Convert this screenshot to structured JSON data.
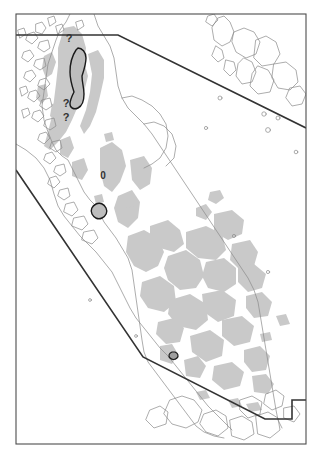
{
  "map": {
    "type": "distribution-range-map",
    "title": "",
    "background_color": "#ffffff",
    "frame": {
      "stroke": "#4d4d4d",
      "stroke_width": 1.1,
      "x": 16,
      "y": 14,
      "width": 290,
      "height": 430
    },
    "colors": {
      "frame_border": "#4d4d4d",
      "coastline": "#8a8a8a",
      "habitat_shading": "#c9c9c9",
      "range_boundary": "#333333",
      "core_polygon_fill": "#bdbdbd",
      "core_polygon_stroke": "#1a1a1a",
      "label_text": "#333333"
    },
    "labels": [
      {
        "text": "?",
        "x": 69,
        "y": 42,
        "size": 11
      },
      {
        "text": "?",
        "x": 66,
        "y": 107,
        "size": 11
      },
      {
        "text": "?",
        "x": 66,
        "y": 121,
        "size": 11
      },
      {
        "text": "0",
        "x": 103,
        "y": 179,
        "size": 10
      }
    ],
    "range_boundary_segments": [
      {
        "name": "northern-limit-horizontal",
        "points": "16,35 118,35"
      },
      {
        "name": "northern-limit-diagonal",
        "points": "118,35 306,128"
      },
      {
        "name": "southwestern-limit-diagonal",
        "points": "16,170 143,357"
      },
      {
        "name": "southern-limit-diagonal",
        "points": "143,357 265,419"
      },
      {
        "name": "southeastern-limit-step",
        "points": "265,419 292,419 292,400 306,400"
      }
    ],
    "core_polygons": [
      {
        "name": "northern-core-range",
        "x": 78,
        "y": 68,
        "label": "elongated highland core area"
      },
      {
        "name": "central-core-range",
        "x": 100,
        "y": 211,
        "label": "small isolated core area"
      },
      {
        "name": "southern-core-range",
        "x": 175,
        "y": 355,
        "label": "tiny southern core area"
      }
    ],
    "legend": {
      "visible": false,
      "items": []
    },
    "scale_bar": {
      "visible": false
    },
    "north_arrow": {
      "visible": false
    }
  }
}
